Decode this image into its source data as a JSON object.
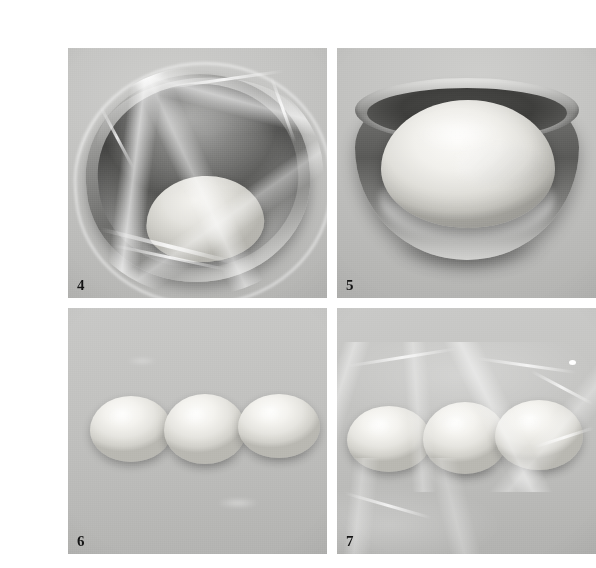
{
  "plate": {
    "description": "Four-panel grayscale photographic plate showing bread dough fermentation and dividing steps",
    "background_color": "#ffffff",
    "panel_background_color": "#b9b9b7",
    "label_color": "#141414",
    "layout": {
      "columns": 2,
      "rows": 2
    }
  },
  "panels": [
    {
      "number": "4",
      "name": "covered-bowl-before-rise",
      "caption": "Dough ball resting in a stainless steel bowl sealed with plastic wrap, viewed at an angle",
      "subjects": [
        "stainless-steel-bowl",
        "plastic-wrap",
        "dough-ball"
      ]
    },
    {
      "number": "5",
      "name": "risen-dough-in-bowl",
      "caption": "Fully risen dough filling a stainless steel bowl, plastic wrap removed",
      "subjects": [
        "stainless-steel-bowl",
        "risen-dough"
      ]
    },
    {
      "number": "6",
      "name": "three-divided-dough-balls",
      "caption": "Three equal dough balls shaped and lined up on a work surface",
      "subjects": [
        "dough-ball",
        "dough-ball",
        "dough-ball"
      ]
    },
    {
      "number": "7",
      "name": "dough-balls-covered-with-wrap",
      "caption": "The three dough balls loosely covered with plastic wrap for the second rise",
      "subjects": [
        "dough-ball",
        "dough-ball",
        "dough-ball",
        "plastic-wrap"
      ]
    }
  ]
}
